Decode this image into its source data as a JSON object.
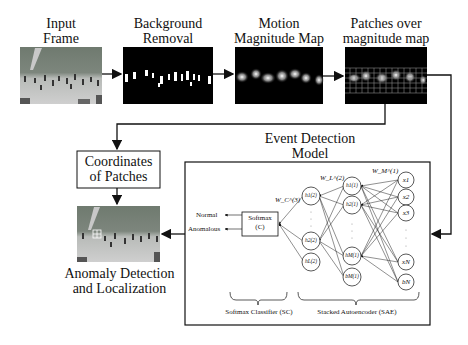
{
  "stages": {
    "input": {
      "label_line1": "Input",
      "label_line2": "Frame"
    },
    "background": {
      "label_line1": "Background",
      "label_line2": "Removal"
    },
    "motion": {
      "label_line1": "Motion",
      "label_line2": "Magnitude Map"
    },
    "patches": {
      "label_line1": "Patches over",
      "label_line2": "magnitude map"
    }
  },
  "coordinates_box": {
    "line1": "Coordinates",
    "line2": "of Patches"
  },
  "anomaly": {
    "line1": "Anomaly Detection",
    "line2": "and Localization"
  },
  "event_model": {
    "title_line1": "Event Detection",
    "title_line2": "Model"
  },
  "softmax": {
    "line1": "Softmax",
    "line2": "(C)",
    "output_normal": "Normal",
    "output_anomalous": "Anomalous",
    "weight": "W_C^(3)"
  },
  "hidden2": {
    "nodes": [
      "h1(2)",
      "h2(2)",
      "hL(2)"
    ],
    "weight": "W_L^(2)"
  },
  "hidden1": {
    "nodes": [
      "h1(1)",
      "h2(1)",
      "hM(1)",
      "bM(1)"
    ],
    "weight": "W_M^(1)"
  },
  "inputs": {
    "nodes": [
      "x1",
      "x2",
      "x3",
      "xN",
      "bN"
    ]
  },
  "braces": {
    "sc": "Softmax Classifier (SC)",
    "sae": "Stacked Autoencoder (SAE)"
  }
}
